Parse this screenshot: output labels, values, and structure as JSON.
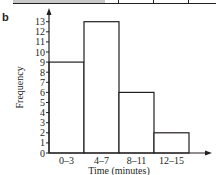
{
  "panel_label": "b",
  "chart_data": {
    "type": "bar",
    "subtype": "histogram",
    "title": "",
    "categories": [
      "0–3",
      "4–7",
      "8–11",
      "12–15"
    ],
    "values": [
      9,
      13,
      6,
      2
    ],
    "xlabel": "Time (minutes)",
    "ylabel": "Frequency",
    "ylim": [
      0,
      13
    ],
    "yticks": [
      0,
      1,
      2,
      3,
      4,
      5,
      6,
      7,
      8,
      9,
      10,
      11,
      12,
      13
    ],
    "grid": false,
    "legend": null,
    "bar_fill": "#ffffff",
    "bar_stroke": "#231f20"
  }
}
